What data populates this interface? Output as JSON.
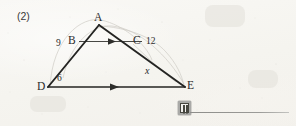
{
  "worksheet": {
    "problem_number": "(2)",
    "background_color": "#f7f6f2",
    "ink_color": "#2b2b2b"
  },
  "figure": {
    "type": "geometry-diagram",
    "vertices": [
      {
        "name": "A",
        "label": "A",
        "x": 99,
        "y": 25
      },
      {
        "name": "B",
        "label": "B",
        "x": 78,
        "y": 41
      },
      {
        "name": "C",
        "label": "C",
        "x": 143,
        "y": 41
      },
      {
        "name": "D",
        "label": "D",
        "x": 48,
        "y": 87
      },
      {
        "name": "E",
        "label": "E",
        "x": 185,
        "y": 87
      }
    ],
    "segments": [
      {
        "name": "AD",
        "from": "A",
        "to": "D",
        "style": "solid-heavy"
      },
      {
        "name": "AE",
        "from": "A",
        "to": "E",
        "style": "solid-heavy"
      },
      {
        "name": "BC",
        "from": "B",
        "to": "C",
        "style": "solid-thin",
        "marker": "arrow-right"
      },
      {
        "name": "DE",
        "from": "D",
        "to": "E",
        "style": "solid-heavy",
        "marker": "arrow-right"
      }
    ],
    "measure_labels": [
      {
        "name": "AB-length",
        "text": "9",
        "x": 56,
        "y": 39,
        "segment": "AB"
      },
      {
        "name": "CE-label",
        "text": "12",
        "x": 146,
        "y": 37,
        "segment": "AC"
      },
      {
        "name": "BD-length",
        "text": "6",
        "x": 57,
        "y": 74,
        "segment": "BD"
      },
      {
        "name": "CE-unknown",
        "text": "x",
        "x": 145,
        "y": 66,
        "segment": "CE",
        "italic": true
      }
    ],
    "annotations": {
      "parallel_marks": "single arrowhead on BC and on DE indicating BC ∥ DE",
      "pencil_arcs": "faint light-grey arcs sketched over the figure"
    }
  },
  "answer_area": {
    "icon_name": "book-icon",
    "rule_label": "answer-blank-line"
  }
}
